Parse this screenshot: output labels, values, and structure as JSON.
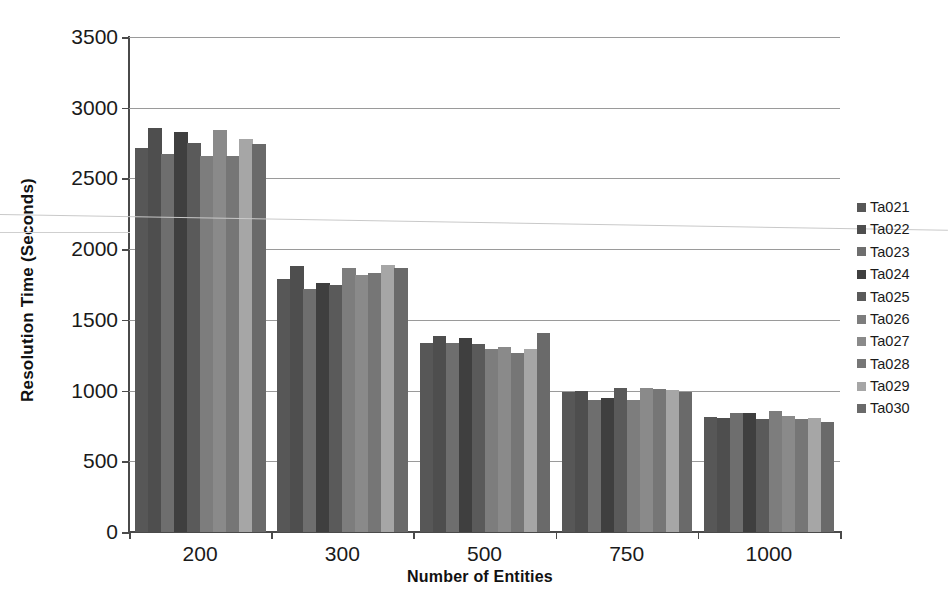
{
  "chart_data": {
    "type": "bar",
    "title": "",
    "xlabel": "Number of Entities",
    "ylabel": "Resolution Time (Seconds)",
    "categories": [
      "200",
      "300",
      "500",
      "750",
      "1000"
    ],
    "ylim": [
      0,
      3500
    ],
    "yticks": [
      0,
      500,
      1000,
      1500,
      2000,
      2500,
      3000,
      3500
    ],
    "ytick_labels": [
      "0",
      "500",
      "1000",
      "1500",
      "2000",
      "2500",
      "3000",
      "3500"
    ],
    "grid": true,
    "legend_position": "right",
    "series": [
      {
        "name": "Ta021",
        "color": "#575757",
        "values": [
          2715,
          1790,
          1340,
          990,
          810
        ]
      },
      {
        "name": "Ta022",
        "color": "#4e4e4e",
        "values": [
          2855,
          1880,
          1385,
          1000,
          805
        ]
      },
      {
        "name": "Ta023",
        "color": "#6e6e6e",
        "values": [
          2670,
          1720,
          1340,
          935,
          845
        ]
      },
      {
        "name": "Ta024",
        "color": "#3f3f3f",
        "values": [
          2830,
          1760,
          1370,
          945,
          840
        ]
      },
      {
        "name": "Ta025",
        "color": "#5a5a5a",
        "values": [
          2750,
          1745,
          1330,
          1015,
          800
        ]
      },
      {
        "name": "Ta026",
        "color": "#7d7d7d",
        "values": [
          2660,
          1865,
          1295,
          930,
          855
        ]
      },
      {
        "name": "Ta027",
        "color": "#8a8a8a",
        "values": [
          2845,
          1815,
          1305,
          1020,
          820
        ]
      },
      {
        "name": "Ta028",
        "color": "#767676",
        "values": [
          2660,
          1830,
          1265,
          1010,
          800
        ]
      },
      {
        "name": "Ta029",
        "color": "#a6a6a6",
        "values": [
          2780,
          1890,
          1295,
          1005,
          805
        ]
      },
      {
        "name": "Ta030",
        "color": "#6a6a6a",
        "values": [
          2745,
          1870,
          1410,
          990,
          780
        ]
      }
    ]
  },
  "axis": {
    "y_title": "Resolution Time (Seconds)",
    "x_title": "Number of Entities"
  }
}
